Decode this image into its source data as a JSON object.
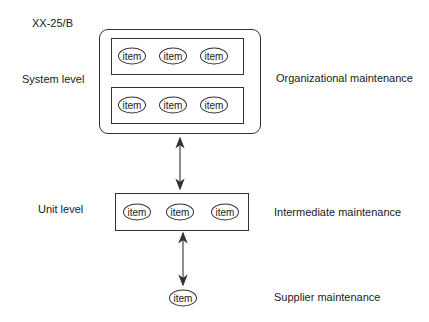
{
  "figure_id": "XX-25/B",
  "levels": {
    "system": "System level",
    "unit": "Unit level"
  },
  "maintenance": {
    "organizational": "Organizational maintenance",
    "intermediate": "Intermediate maintenance",
    "supplier": "Supplier maintenance"
  },
  "item_label": "item",
  "system_rows": [
    [
      "item",
      "item",
      "item"
    ],
    [
      "item",
      "item",
      "item"
    ]
  ],
  "unit_items": [
    "item",
    "item",
    "item"
  ],
  "supplier_item": "item",
  "colors": {
    "line": "#333333",
    "text": "#1a1a1a",
    "background": "#ffffff"
  }
}
